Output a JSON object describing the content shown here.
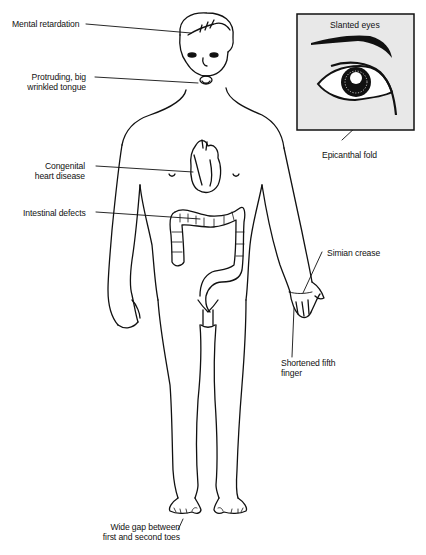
{
  "figure": {
    "labels": {
      "mental_retardation": "Mental retardation",
      "tongue_line1": "Protruding, big",
      "tongue_line2": "wrinkled tongue",
      "heart_line1": "Congenital",
      "heart_line2": "heart disease",
      "intestinal": "Intestinal defects",
      "simian_crease": "Simian crease",
      "finger_line1": "Shortened fifth",
      "finger_line2": "finger",
      "toes_line1": "Wide gap between",
      "toes_line2": "first and second toes",
      "epicanthal_fold": "Epicanthal fold"
    },
    "inset": {
      "title": "Slanted eyes",
      "background": "#e8e8e8",
      "border": "#111111"
    },
    "colors": {
      "ink": "#111111",
      "paper": "#ffffff"
    }
  }
}
